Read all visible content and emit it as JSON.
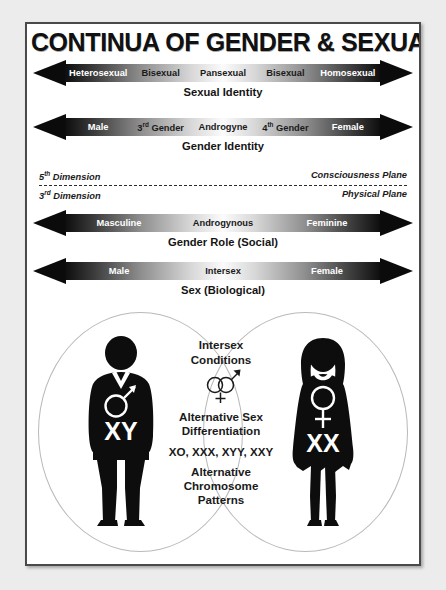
{
  "poster": {
    "title": "CONTINUA OF GENDER & SEXUAL IDENTITY",
    "frame_color": "#4a4a4a",
    "background_color": "#ffffff",
    "page_background_color": "#ececed"
  },
  "continua": [
    {
      "id": "sexual-identity",
      "caption": "Sexual Identity",
      "labels": [
        {
          "text": "Heterosexual",
          "tone": "end"
        },
        {
          "text": "Bisexual",
          "tone": "mid"
        },
        {
          "text": "Pansexual",
          "tone": "mid"
        },
        {
          "text": "Bisexual",
          "tone": "mid"
        },
        {
          "text": "Homosexual",
          "tone": "end"
        }
      ]
    },
    {
      "id": "gender-identity",
      "caption": "Gender Identity",
      "labels": [
        {
          "text": "Male",
          "tone": "end"
        },
        {
          "text": "3",
          "sup": "rd",
          "after": " Gender",
          "tone": "mid"
        },
        {
          "text": "Androgyne",
          "tone": "mid"
        },
        {
          "text": "4",
          "sup": "th",
          "after": " Gender",
          "tone": "mid"
        },
        {
          "text": "Female",
          "tone": "end"
        }
      ]
    },
    {
      "id": "gender-role",
      "caption": "Gender Role (Social)",
      "labels": [
        {
          "text": "Masculine",
          "tone": "end"
        },
        {
          "text": "Androgynous",
          "tone": "mid"
        },
        {
          "text": "Feminine",
          "tone": "end"
        }
      ]
    },
    {
      "id": "sex-biological",
      "caption": "Sex (Biological)",
      "labels": [
        {
          "text": "Male",
          "tone": "end"
        },
        {
          "text": "Intersex",
          "tone": "mid"
        },
        {
          "text": "Female",
          "tone": "end"
        }
      ]
    }
  ],
  "planes": {
    "upper_left_number": "5",
    "upper_left_sup": "th",
    "upper_left_word": " Dimension",
    "upper_right": "Consciousness Plane",
    "lower_left_number": "3",
    "lower_left_sup": "rd",
    "lower_left_word": " Dimension",
    "lower_right": "Physical Plane"
  },
  "venn": {
    "left_figure": {
      "chromosomes": "XY",
      "symbol": "male-symbol"
    },
    "right_figure": {
      "chromosomes": "XX",
      "symbol": "female-symbol"
    },
    "center": {
      "line1": "Intersex",
      "line2": "Conditions",
      "symbol": "intersex-symbol",
      "line3": "Alternative Sex",
      "line4": "Differentiation",
      "line5": "XO, XXX, XYY, XXY",
      "line6": "Alternative",
      "line7": "Chromosome",
      "line8": "Patterns"
    }
  }
}
